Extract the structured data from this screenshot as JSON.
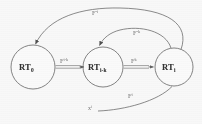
{
  "figure": {
    "type": "state-transition-diagram",
    "background_color": "#fdfdfd",
    "stroke_color": "#555555",
    "text_color": "#2b2b2b"
  },
  "nodes": [
    {
      "id": "rt0",
      "base": "RT",
      "sub": "0",
      "cx": 33,
      "cy": 67,
      "r": 22
    },
    {
      "id": "rtik",
      "base": "RT",
      "sub": "i-k",
      "cx": 103,
      "cy": 67,
      "r": 20
    },
    {
      "id": "rti",
      "base": "RT",
      "sub": "i",
      "cx": 174,
      "cy": 67,
      "r": 19
    }
  ],
  "edges": [
    {
      "id": "e1",
      "label_base": "F",
      "label_sup": "i-k",
      "from": "rt0",
      "to": "rtik",
      "style": "straight-double"
    },
    {
      "id": "e2",
      "label_base": "F",
      "label_sup": "k",
      "from": "rtik",
      "to": "rti",
      "style": "straight-double"
    },
    {
      "id": "e3",
      "label_base": "F",
      "label_sup": "-k",
      "from": "rti",
      "to": "rtik",
      "style": "arc-upper"
    },
    {
      "id": "e4",
      "label_base": "F",
      "label_sup": "-i",
      "from": "rti",
      "to": "rt0",
      "style": "arc-outer"
    },
    {
      "id": "e5",
      "label_base": "F",
      "label_sup": "i",
      "from": "x",
      "to": "rti",
      "style": "arc-lower"
    }
  ],
  "edge_labels": {
    "top_outer": {
      "base": "F",
      "sup": "-i"
    },
    "upper_inner": {
      "base": "F",
      "sup": "-k"
    },
    "left_middle": {
      "base": "F",
      "sup": "i-k"
    },
    "right_middle": {
      "base": "F",
      "sup": "k"
    },
    "bottom": {
      "base": "F",
      "sup": "i"
    }
  },
  "source": {
    "base": "x",
    "sup": "i"
  }
}
